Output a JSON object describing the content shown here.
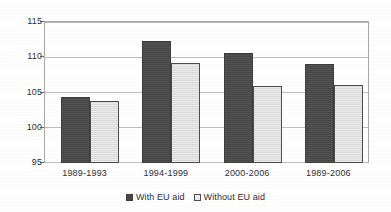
{
  "chart_data": {
    "type": "bar",
    "title": "",
    "subtitle": "",
    "xlabel": "",
    "ylabel": "",
    "categories": [
      "1989-1993",
      "1994-1999",
      "2000-2006",
      "1989-2006"
    ],
    "series": [
      {
        "name": "With EU aid",
        "color": "#4a4a4a",
        "values": [
          104.3,
          112.2,
          110.5,
          108.9
        ]
      },
      {
        "name": "Without EU aid",
        "color": "#e2e2e2",
        "values": [
          103.8,
          109.1,
          105.8,
          106.0
        ]
      }
    ],
    "ylim": [
      95,
      115
    ],
    "yticks": [
      95,
      100,
      105,
      110,
      115
    ],
    "ytick_labels": [
      "95",
      "100",
      "105",
      "110",
      "115"
    ],
    "grid": true,
    "grid_axis": "y",
    "legend": {
      "position": "bottom",
      "entries": [
        {
          "label": "With EU aid",
          "swatch": "dark-swatch-icon"
        },
        {
          "label": "Without EU aid",
          "swatch": "light-swatch-icon"
        }
      ]
    },
    "plot_border": true,
    "background_color": "#ffffff",
    "axis_color": "#a8a8a8",
    "gridline_color": "#bdbdbd",
    "text_color": "#2e2e2e"
  }
}
